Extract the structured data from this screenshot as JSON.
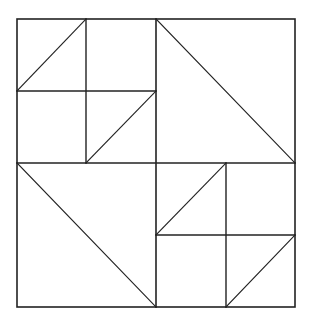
{
  "diagram": {
    "stroke_color": "#222222",
    "background_color": "#ffffff",
    "outer_square": {
      "x1": 17,
      "y1": 19,
      "x2": 295,
      "y2": 307
    },
    "mid_lines": [
      {
        "name": "center-vertical",
        "x1": 156,
        "y1": 19,
        "x2": 156,
        "y2": 307
      },
      {
        "name": "center-horizontal",
        "x1": 17,
        "y1": 163,
        "x2": 295,
        "y2": 163
      }
    ],
    "quadrants": [
      {
        "name": "top-left",
        "subgrid": [
          {
            "x1": 86,
            "y1": 19,
            "x2": 86,
            "y2": 163
          },
          {
            "x1": 17,
            "y1": 91,
            "x2": 156,
            "y2": 91
          }
        ],
        "diagonals": [
          {
            "x1": 17,
            "y1": 91,
            "x2": 86,
            "y2": 19
          },
          {
            "x1": 86,
            "y1": 163,
            "x2": 156,
            "y2": 91
          }
        ]
      },
      {
        "name": "top-right",
        "subgrid": [],
        "diagonals": [
          {
            "x1": 156,
            "y1": 19,
            "x2": 295,
            "y2": 163
          }
        ]
      },
      {
        "name": "bottom-left",
        "subgrid": [],
        "diagonals": [
          {
            "x1": 17,
            "y1": 163,
            "x2": 156,
            "y2": 307
          }
        ]
      },
      {
        "name": "bottom-right",
        "subgrid": [
          {
            "x1": 226,
            "y1": 163,
            "x2": 226,
            "y2": 307
          },
          {
            "x1": 156,
            "y1": 235,
            "x2": 295,
            "y2": 235
          }
        ],
        "diagonals": [
          {
            "x1": 156,
            "y1": 235,
            "x2": 226,
            "y2": 163
          },
          {
            "x1": 226,
            "y1": 307,
            "x2": 295,
            "y2": 235
          }
        ]
      }
    ]
  }
}
